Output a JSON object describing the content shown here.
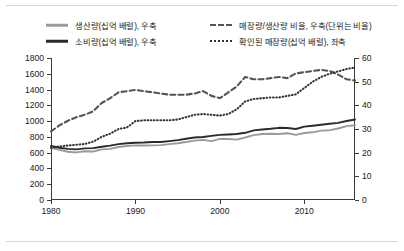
{
  "legend": {
    "items": [
      {
        "label": "생산량(십억 배럴), 우축",
        "style": "solid-light",
        "icon": "legend-line-solid-light"
      },
      {
        "label": "매장량/생산량 비율, 우축(단위는 비율)",
        "style": "dashed",
        "icon": "legend-line-dashed"
      },
      {
        "label": "소비량(십억 배럴), 우축",
        "style": "solid-dark",
        "icon": "legend-line-solid-dark"
      },
      {
        "label": "확인된 매장량(십억 배럴), 좌축",
        "style": "dotted",
        "icon": "legend-line-dotted"
      }
    ]
  },
  "colors": {
    "production": "#9b9b9b",
    "consumption": "#2b2b2b",
    "rp_ratio": "#555555",
    "reserves": "#333333",
    "axis": "#3a3a3a",
    "text": "#1a1a1a",
    "rule": "#d8d8d8"
  },
  "chart_data": {
    "type": "line",
    "title": "",
    "xlabel": "",
    "ylabel": "",
    "grid": false,
    "legend_position": "top",
    "x": [
      1980,
      1981,
      1982,
      1983,
      1984,
      1985,
      1986,
      1987,
      1988,
      1989,
      1990,
      1991,
      1992,
      1993,
      1994,
      1995,
      1996,
      1997,
      1998,
      1999,
      2000,
      2001,
      2002,
      2003,
      2004,
      2005,
      2006,
      2007,
      2008,
      2009,
      2010,
      2011,
      2012,
      2013,
      2014,
      2015,
      2016
    ],
    "xlim": [
      1980,
      2016
    ],
    "xticks": [
      1980,
      1990,
      2000,
      2010
    ],
    "xticklabels": [
      "1980",
      "1990",
      "2000",
      "2010"
    ],
    "axes": [
      {
        "name": "left",
        "label": "좌축",
        "ylim": [
          0,
          1800
        ],
        "yticks": [
          0,
          200,
          400,
          600,
          800,
          1000,
          1200,
          1400,
          1600,
          1800
        ],
        "yticklabels": [
          "0",
          "200",
          "400",
          "600",
          "800",
          "1000",
          "1200",
          "1400",
          "1600",
          "1800"
        ]
      },
      {
        "name": "right",
        "label": "우축",
        "ylim": [
          0,
          60
        ],
        "yticks": [
          0,
          10,
          20,
          30,
          40,
          50,
          60
        ],
        "yticklabels": [
          "0",
          "10",
          "20",
          "30",
          "40",
          "50",
          "60"
        ]
      }
    ],
    "series": [
      {
        "name": "생산량(십억 배럴), 우축",
        "short": "production",
        "axis": "right",
        "style": "solid",
        "color": "#9b9b9b",
        "values": [
          22.0,
          21.2,
          20.4,
          20.1,
          20.6,
          20.5,
          21.4,
          21.6,
          22.4,
          22.8,
          23.1,
          23.0,
          23.1,
          23.2,
          23.6,
          24.0,
          24.5,
          25.1,
          25.4,
          24.9,
          25.8,
          25.8,
          25.5,
          26.4,
          27.4,
          27.9,
          28.0,
          27.9,
          28.2,
          27.5,
          28.3,
          28.6,
          29.3,
          29.5,
          30.2,
          31.2,
          31.6
        ]
      },
      {
        "name": "소비량(십억 배럴), 우축",
        "short": "consumption",
        "axis": "right",
        "style": "solid",
        "color": "#2b2b2b",
        "values": [
          22.8,
          22.1,
          21.6,
          21.4,
          21.8,
          21.9,
          22.5,
          23.0,
          23.6,
          24.0,
          24.2,
          24.3,
          24.5,
          24.5,
          24.9,
          25.3,
          25.9,
          26.4,
          26.6,
          27.1,
          27.5,
          27.7,
          27.9,
          28.4,
          29.4,
          29.8,
          30.1,
          30.5,
          30.4,
          30.0,
          31.0,
          31.4,
          31.8,
          32.2,
          32.6,
          33.4,
          34.0
        ]
      },
      {
        "name": "매장량/생산량 비율, 우축(단위는 비율)",
        "short": "rp_ratio",
        "axis": "right",
        "style": "dashed",
        "color": "#555555",
        "values": [
          29.0,
          31.5,
          33.5,
          35.0,
          36.0,
          37.5,
          41.0,
          43.0,
          45.5,
          46.0,
          46.5,
          46.0,
          45.5,
          45.0,
          44.5,
          44.5,
          44.5,
          45.0,
          46.0,
          44.0,
          43.0,
          45.5,
          48.0,
          52.0,
          51.0,
          51.0,
          51.5,
          52.0,
          51.5,
          53.5,
          54.0,
          54.5,
          55.0,
          54.5,
          53.0,
          51.0,
          50.5
        ]
      },
      {
        "name": "확인된 매장량(십억 배럴), 좌축",
        "short": "reserves",
        "axis": "left",
        "style": "dotted",
        "color": "#333333",
        "values": [
          660,
          680,
          690,
          700,
          710,
          740,
          800,
          840,
          900,
          920,
          1000,
          1010,
          1010,
          1010,
          1010,
          1020,
          1050,
          1080,
          1090,
          1080,
          1070,
          1090,
          1150,
          1250,
          1280,
          1290,
          1300,
          1300,
          1320,
          1340,
          1420,
          1500,
          1560,
          1600,
          1630,
          1660,
          1680
        ]
      }
    ]
  }
}
